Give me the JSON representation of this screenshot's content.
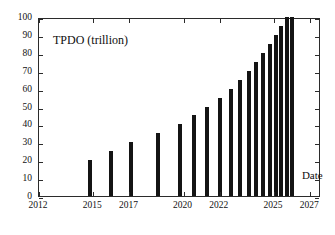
{
  "chart_data": {
    "type": "bar",
    "title": "TPDO (trillion)",
    "xlabel": "Date",
    "ylabel": "",
    "xlim": [
      2012,
      2027.6
    ],
    "ylim": [
      0,
      100
    ],
    "grid": false,
    "legend": null,
    "x": [
      2014.8,
      2016.0,
      2017.1,
      2018.6,
      2019.8,
      2020.6,
      2021.3,
      2022.0,
      2022.6,
      2023.1,
      2023.6,
      2024.0,
      2024.4,
      2024.8,
      2025.1,
      2025.4,
      2025.7,
      2026.0
    ],
    "values": [
      20,
      25,
      30,
      35,
      40,
      45,
      50,
      55,
      60,
      65,
      70,
      75,
      80,
      85,
      90,
      95,
      100,
      100
    ],
    "categories": [
      "2014.8",
      "2016.0",
      "2017.1",
      "2018.6",
      "2019.8",
      "2020.6",
      "2021.3",
      "2022.0",
      "2022.6",
      "2023.1",
      "2023.6",
      "2024.0",
      "2024.4",
      "2024.8",
      "2025.1",
      "2025.4",
      "2025.7",
      "2026.0"
    ],
    "bar_color": "#141414",
    "axis_color": "#2b2b2b",
    "xticks": [
      2012,
      2015,
      2017,
      2020,
      2022,
      2025,
      2027
    ],
    "xticklabels": [
      "2012",
      "2015",
      "2017",
      "2020",
      "2022",
      "2025",
      "2027"
    ],
    "yticks": [
      0,
      10,
      20,
      30,
      40,
      50,
      60,
      70,
      80,
      90,
      100
    ],
    "yticklabels": [
      "0",
      "10",
      "20",
      "30",
      "40",
      "50",
      "60",
      "70",
      "80",
      "90",
      "100"
    ]
  }
}
